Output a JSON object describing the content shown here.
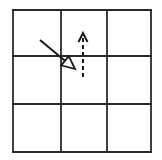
{
  "diagram": {
    "type": "grid-with-arrows",
    "grid": {
      "rows": 3,
      "cols": 3,
      "left": 13,
      "top": 10,
      "right": 151,
      "bottom": 152,
      "col_lines": [
        13,
        61,
        107,
        151
      ],
      "row_lines": [
        10,
        56,
        104,
        152
      ],
      "stroke": "#2a2a2a",
      "stroke_width": 1.8
    },
    "arrows": [
      {
        "name": "solid-diagonal-arrow",
        "style": "solid",
        "head": "hollow-triangle",
        "from": [
          40,
          40
        ],
        "to": [
          75,
          69
        ],
        "color": "#1a1a1a"
      },
      {
        "name": "dashed-vertical-arrow",
        "style": "dashed",
        "head": "open-chevron",
        "from": [
          83,
          77
        ],
        "to": [
          83,
          33
        ],
        "color": "#1a1a1a"
      }
    ]
  }
}
